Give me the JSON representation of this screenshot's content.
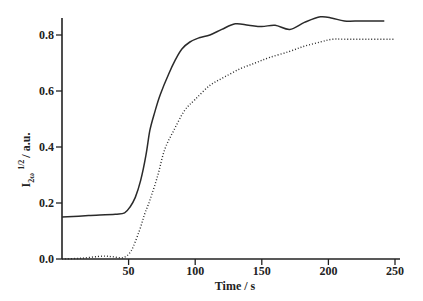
{
  "chart_data": {
    "type": "line",
    "title": "",
    "xlabel": "Time / s",
    "ylabel": "I_2ω^1/2 / a.u.",
    "ylabel_parts": {
      "main": "I",
      "sub": "2ω",
      "sup": "1/2",
      "rest": "/ a.u."
    },
    "xlim": [
      0,
      250
    ],
    "ylim": [
      0,
      0.85
    ],
    "xticks": [
      50,
      100,
      150,
      200,
      250
    ],
    "xtick_labels": [
      "50",
      "100",
      "150",
      "200",
      "250"
    ],
    "yticks": [
      0.0,
      0.2,
      0.4,
      0.6,
      0.8
    ],
    "ytick_labels": [
      "0.0",
      "0.2",
      "0.4",
      "0.6",
      "0.8"
    ],
    "grid": false,
    "legend": null,
    "series": [
      {
        "name": "solid",
        "style": "solid",
        "x": [
          0,
          20,
          40,
          47,
          51,
          55,
          59,
          63,
          66,
          70,
          74,
          80,
          85,
          90,
          96,
          103,
          111,
          120,
          130,
          140,
          150,
          160,
          171,
          182,
          194,
          203,
          212,
          225,
          242
        ],
        "values": [
          0.15,
          0.155,
          0.16,
          0.165,
          0.185,
          0.22,
          0.28,
          0.37,
          0.46,
          0.53,
          0.59,
          0.66,
          0.71,
          0.75,
          0.775,
          0.79,
          0.8,
          0.82,
          0.84,
          0.835,
          0.83,
          0.835,
          0.82,
          0.845,
          0.865,
          0.86,
          0.85,
          0.85,
          0.85
        ]
      },
      {
        "name": "dotted",
        "style": "dotted",
        "x": [
          0,
          15,
          30,
          38,
          46,
          52,
          58,
          62,
          66,
          72,
          77,
          84,
          92,
          100,
          111,
          122,
          134,
          145,
          156,
          170,
          182,
          194,
          203,
          212,
          230,
          250
        ],
        "values": [
          0.0,
          0.003,
          0.01,
          0.008,
          0.005,
          0.03,
          0.1,
          0.16,
          0.21,
          0.3,
          0.39,
          0.46,
          0.53,
          0.57,
          0.62,
          0.65,
          0.68,
          0.7,
          0.72,
          0.74,
          0.76,
          0.775,
          0.785,
          0.785,
          0.785,
          0.785
        ]
      }
    ]
  }
}
